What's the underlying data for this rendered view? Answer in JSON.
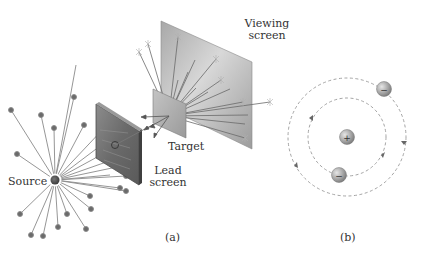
{
  "figure": {
    "panel_a": {
      "caption": "(a)",
      "labels": {
        "source": "Source",
        "lead_screen_line1": "Lead",
        "lead_screen_line2": "screen",
        "target": "Target",
        "viewing_screen_line1": "Viewing",
        "viewing_screen_line2": "screen"
      }
    },
    "panel_b": {
      "caption": "(b)",
      "nucleus_symbol": "+",
      "electron_symbol": "−"
    },
    "colors": {
      "ray": "#8a8a8a",
      "dot": "#6a6a6a",
      "screen_dark": "#6e6e6e",
      "screen_light": "#c9c9c9",
      "orbit": "#9a9a9a",
      "text": "#333333"
    }
  }
}
